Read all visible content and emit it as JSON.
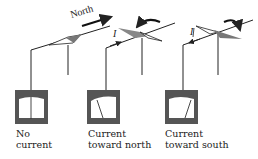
{
  "figure": {
    "north_label": "North",
    "current_symbol": "I",
    "panels": [
      {
        "id": "no-current",
        "caption_line1": "No",
        "caption_line2": "current",
        "needle": "center",
        "compass": "aligned-north"
      },
      {
        "id": "current-north",
        "caption_line1": "Current",
        "caption_line2": "toward north",
        "needle": "deflected-left",
        "compass": "deflected",
        "rotation_arrow": "counterclockwise"
      },
      {
        "id": "current-south",
        "caption_line1": "Current",
        "caption_line2": "toward south",
        "needle": "deflected-right",
        "compass": "deflected",
        "rotation_arrow": "clockwise"
      }
    ]
  },
  "colors": {
    "line": "#222222",
    "meter_frame": "#5a5a5a",
    "meter_face": "#ffffff",
    "compass_shade": "#8a8a8a"
  }
}
